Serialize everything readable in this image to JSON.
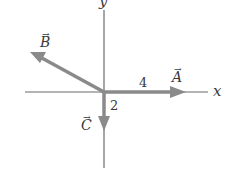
{
  "diagram": {
    "axes": {
      "x_label": "x",
      "y_label": "y",
      "color": "#6b6b6b"
    },
    "vectors": [
      {
        "name": "A",
        "label": "A",
        "magnitude_label": "4",
        "direction": "+x",
        "color": "#8a8a8a"
      },
      {
        "name": "B",
        "label": "B",
        "magnitude_label": "",
        "direction": "up-left",
        "color": "#8a8a8a"
      },
      {
        "name": "C",
        "label": "C",
        "magnitude_label": "2",
        "direction": "-y",
        "color": "#8a8a8a"
      }
    ],
    "arrow_symbol": "→"
  }
}
